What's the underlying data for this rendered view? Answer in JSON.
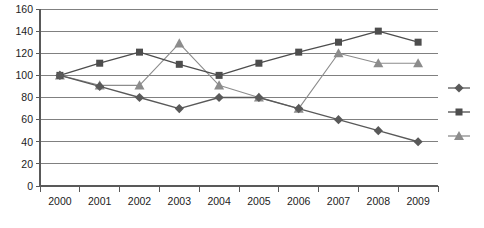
{
  "chart_data": {
    "type": "line",
    "title": "",
    "subtitle": "",
    "xlabel": "",
    "ylabel": "",
    "categories": [
      "2000",
      "2001",
      "2002",
      "2003",
      "2004",
      "2005",
      "2006",
      "2007",
      "2008",
      "2009"
    ],
    "x": [
      2000,
      2001,
      2002,
      2003,
      2004,
      2005,
      2006,
      2007,
      2008,
      2009
    ],
    "ylim": [
      0,
      160
    ],
    "yticks": [
      0,
      20,
      40,
      60,
      80,
      100,
      120,
      140,
      160
    ],
    "ytick_labels": [
      "0",
      "20",
      "40",
      "60",
      "80",
      "100",
      "120",
      "140",
      "160"
    ],
    "grid": "horizontal",
    "legend_position": "right",
    "legend_labels_visible": false,
    "series": [
      {
        "name": "series-1",
        "marker": "diamond",
        "color": "#595959",
        "values": [
          100,
          90,
          80,
          70,
          80,
          80,
          70,
          60,
          50,
          40
        ]
      },
      {
        "name": "series-2",
        "marker": "square",
        "color": "#4d4d4d",
        "values": [
          100,
          111,
          121,
          110,
          100,
          111,
          121,
          130,
          140,
          130
        ]
      },
      {
        "name": "series-3",
        "marker": "triangle",
        "color": "#8c8c8c",
        "values": [
          100,
          91,
          91,
          129,
          91,
          80,
          70,
          120,
          111,
          111
        ]
      }
    ]
  },
  "legend": {
    "entries": [
      {
        "marker": "diamond",
        "color": "#595959",
        "label": ""
      },
      {
        "marker": "square",
        "color": "#4d4d4d",
        "label": ""
      },
      {
        "marker": "triangle",
        "color": "#8c8c8c",
        "label": ""
      }
    ]
  },
  "style": {
    "background": "#ffffff",
    "gridline_color": "#808080",
    "axis_color": "#595959",
    "tick_text_color": "#1c1c1c"
  }
}
